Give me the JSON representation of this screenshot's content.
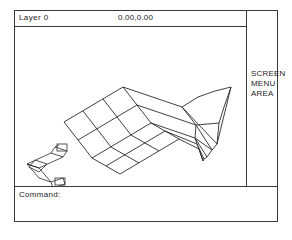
{
  "status_bar": {
    "layer_label": "Layer 0",
    "coordinates": "0.00,0.00"
  },
  "screen_menu": {
    "line1": "SCREEN",
    "line2": "MENU",
    "line3": "AREA"
  },
  "command_line": {
    "prompt": "Command:",
    "input_value": ""
  },
  "ucs_icon": {
    "x_label": "X",
    "y_label": "Y"
  },
  "drawing": {
    "mesh_rows": 4,
    "mesh_cols": 4
  },
  "colors": {
    "background": "#ffffff",
    "line": "#2b2b2b",
    "frame": "#3a3a3a",
    "text": "#1c1c1c"
  }
}
